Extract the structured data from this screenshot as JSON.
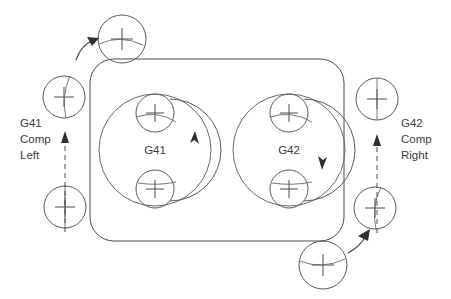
{
  "diagram": {
    "background_color": "#ffffff",
    "line_color": "#4a4a4a",
    "text_color": "#3c3c3c",
    "left_annotation": {
      "line1": "G41",
      "line2": "Comp",
      "line3": "Left",
      "arrow_direction": "up",
      "arrow_style": "dashed"
    },
    "right_annotation": {
      "line1": "G42",
      "line2": "Comp",
      "line3": "Right",
      "arrow_direction": "up",
      "arrow_style": "dashed"
    },
    "pockets": [
      {
        "label": "G41",
        "center_x": 155,
        "center_y": 150,
        "radius": 56,
        "rotation": "counterclockwise",
        "arrow_side": "right",
        "arrow_direction": "up"
      },
      {
        "label": "G42",
        "center_x": 289,
        "center_y": 150,
        "radius": 56,
        "rotation": "clockwise",
        "arrow_side": "right",
        "arrow_direction": "down"
      }
    ],
    "tool_positions": [
      {
        "name": "top-lead-in-tool",
        "x": 122,
        "y": 39,
        "r": 24
      },
      {
        "name": "left-upper-tool",
        "x": 64,
        "y": 97,
        "r": 21
      },
      {
        "name": "left-lower-tool",
        "x": 65,
        "y": 207,
        "r": 21
      },
      {
        "name": "right-upper-tool",
        "x": 377,
        "y": 99,
        "r": 21
      },
      {
        "name": "right-lower-tool",
        "x": 375,
        "y": 208,
        "r": 21
      },
      {
        "name": "bottom-lead-in-tool",
        "x": 323,
        "y": 265,
        "r": 24
      },
      {
        "name": "pocket-left-top-tool",
        "x": 155,
        "y": 113,
        "r": 19
      },
      {
        "name": "pocket-left-bottom-tool",
        "x": 155,
        "y": 189,
        "r": 19
      },
      {
        "name": "pocket-right-top-tool",
        "x": 289,
        "y": 113,
        "r": 19
      },
      {
        "name": "pocket-right-bottom-tool",
        "x": 289,
        "y": 189,
        "r": 19
      }
    ],
    "stock": {
      "x": 90,
      "y": 59,
      "width": 254,
      "height": 182,
      "corner_radius": 24
    }
  }
}
